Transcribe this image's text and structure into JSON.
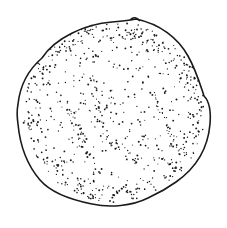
{
  "figure": {
    "width": 227,
    "height": 228,
    "colors": {
      "background": "#ffffff",
      "ink": "#1a1a1a"
    }
  }
}
